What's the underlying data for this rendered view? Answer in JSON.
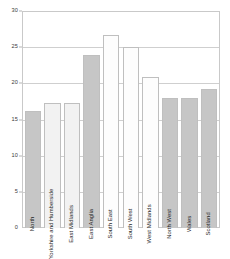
{
  "chart_data": {
    "type": "bar",
    "title": "",
    "subtitle": "",
    "xlabel": "",
    "ylabel": "",
    "ylim": [
      0,
      30
    ],
    "ytick_labels": [
      "0",
      "5",
      "10",
      "15",
      "20",
      "25",
      "30"
    ],
    "ytick_values": [
      0,
      5,
      10,
      15,
      20,
      25,
      30
    ],
    "grid": true,
    "legend": "none",
    "categories": [
      "North",
      "Yorkshire and Humberside",
      "East Midlands",
      "East Anglia",
      "South East",
      "South West",
      "West Midlands",
      "North West",
      "Wales",
      "Scotland"
    ],
    "values": [
      16.2,
      17.3,
      17.3,
      24.0,
      26.8,
      25.2,
      21.0,
      18.0,
      18.0,
      19.3
    ],
    "bar_shades": [
      "#c6c6c6",
      "#f2f2f2",
      "#f2f2f2",
      "#c6c6c6",
      "#fdfdfd",
      "#fdfdfd",
      "#fdfdfd",
      "#c6c6c6",
      "#c6c6c6",
      "#c6c6c6"
    ],
    "colors": {
      "frame": "#c9c9c9",
      "grid": "#cfcfcf",
      "bar_border": "#bfbfbf",
      "text": "#1f1f1f",
      "background": "#ffffff"
    }
  }
}
